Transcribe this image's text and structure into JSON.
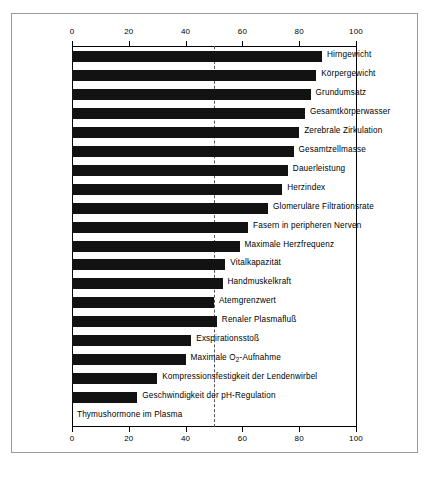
{
  "chart_data": {
    "type": "bar",
    "orientation": "horizontal",
    "title": "",
    "subtitle": "",
    "xlabel": "",
    "ylabel": "",
    "xlim": [
      0,
      100
    ],
    "grid": false,
    "legend": null,
    "axis_top_ticks": [
      "0",
      "20",
      "40",
      "60",
      "80",
      "100"
    ],
    "axis_bottom_ticks": [
      "0",
      "20",
      "40",
      "60",
      "80",
      "100"
    ],
    "tick_values": [
      0,
      20,
      40,
      60,
      80,
      100
    ],
    "reference_line_value": 50,
    "bar_color": "#121212",
    "categories": [
      "Hirngewicht",
      "Körpergewicht",
      "Grundumsatz",
      "Gesamtkörperwasser",
      "Zerebrale Zirkulation",
      "Gesamtzellmasse",
      "Dauerleistung",
      "Herzindex",
      "Glomeruläre Filtrationsrate",
      "Fasern in peripheren Nerven",
      "Maximale Herzfrequenz",
      "Vitalkapazität",
      "Handmuskelkraft",
      "Atemgrenzwert",
      "Renaler Plasmafluß",
      "Exspirationsstoß",
      "Maximale O2-Aufnahme",
      "Kompressionsfestigkeit der Lendenwirbel",
      "Geschwindigkeit der pH-Regulation",
      "Thymushormone im Plasma"
    ],
    "values": [
      88,
      86,
      84,
      82,
      80,
      78,
      76,
      74,
      69,
      62,
      59,
      54,
      53,
      50,
      51,
      42,
      40,
      30,
      23,
      0
    ],
    "labels_html": [
      "Hirngewicht",
      "Körpergewicht",
      "Grundumsatz",
      "Gesamtkörperwasser",
      "Zerebrale Zirkulation",
      "Gesamtzellmasse",
      "Dauerleistung",
      "Herzindex",
      "Glomeruläre Filtrationsrate",
      "Fasern in peripheren Nerven",
      "Maximale Herzfrequenz",
      "Vitalkapazität",
      "Handmuskelkraft",
      "Atemgrenzwert",
      "Renaler Plasmafluß",
      "Exspirationsstoß",
      "Maximale O<sub>2</sub>-Aufnahme",
      "Kompressionsfestigkeit der Lendenwirbel",
      "Geschwindigkeit der pH-Regulation",
      "Thymushormone im Plasma"
    ]
  }
}
